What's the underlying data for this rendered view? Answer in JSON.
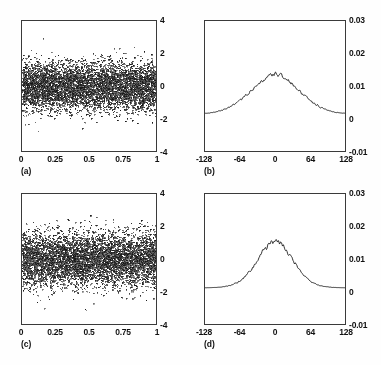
{
  "figure": {
    "title": "",
    "background_color": "#fefefe",
    "frame_color": "#3a3a3a",
    "data_color": "#1a1a1a",
    "layout": "2x2 grid of panels"
  },
  "panels": [
    {
      "id": "a",
      "caption": "(a)",
      "position": {
        "left": 21,
        "top": 20,
        "width": 136,
        "height": 132
      },
      "type": "scatter",
      "xticks": [
        "0",
        "0.25",
        "0.5",
        "0.75",
        "1"
      ],
      "yticks": [
        "4",
        "2",
        "0",
        "-2",
        "-4"
      ],
      "yaxis_side": "right"
    },
    {
      "id": "b",
      "caption": "(b)",
      "position": {
        "left": 204,
        "top": 20,
        "width": 142,
        "height": 132
      },
      "type": "line",
      "xticks": [
        "-128",
        "-64",
        "0",
        "64",
        "128"
      ],
      "yticks": [
        "0.03",
        "0.02",
        "0.01",
        "0",
        "-0.01"
      ],
      "yaxis_side": "right"
    },
    {
      "id": "c",
      "caption": "(c)",
      "position": {
        "left": 21,
        "top": 193,
        "width": 136,
        "height": 132
      },
      "type": "scatter",
      "xticks": [
        "0",
        "0.25",
        "0.5",
        "0.75",
        "1"
      ],
      "yticks": [
        "4",
        "2",
        "0",
        "-2",
        "-4"
      ],
      "yaxis_side": "right"
    },
    {
      "id": "d",
      "caption": "(d)",
      "position": {
        "left": 204,
        "top": 193,
        "width": 142,
        "height": 132
      },
      "type": "line",
      "xticks": [
        "-128",
        "-64",
        "0",
        "64",
        "128"
      ],
      "yticks": [
        "0.03",
        "0.02",
        "0.01",
        "0",
        "-0.01"
      ],
      "yaxis_side": "right"
    }
  ],
  "chart_data": [
    {
      "type": "scatter",
      "panel": "a",
      "title": "(a)",
      "xlabel": "",
      "ylabel": "",
      "xlim": [
        0,
        1
      ],
      "ylim": [
        -4,
        4
      ],
      "xticks": [
        0,
        0.25,
        0.5,
        0.75,
        1
      ],
      "yticks": [
        -4,
        -2,
        0,
        2,
        4
      ],
      "xtick_labels": [
        "0",
        "0.25",
        "0.5",
        "0.75",
        "1"
      ],
      "ytick_labels": [
        "-4",
        "-2",
        "0",
        "2",
        "4"
      ],
      "grid": false,
      "legend": null,
      "description": "Dense uniform random noise scatter, zero mean, spread mostly within +/-1.5 with sparse tails out to about +/-2.5; no visible trend across x.",
      "n_points": 6000,
      "noise_sigma": 0.72,
      "mean": 0.0,
      "seed": 101,
      "marker_size_px": 1
    },
    {
      "type": "line",
      "panel": "b",
      "title": "(b)",
      "xlabel": "",
      "ylabel": "",
      "xlim": [
        -128,
        128
      ],
      "ylim": [
        -0.01,
        0.03
      ],
      "xticks": [
        -128,
        -64,
        0,
        64,
        128
      ],
      "yticks": [
        -0.01,
        0,
        0.01,
        0.02,
        0.03
      ],
      "xtick_labels": [
        "-128",
        "-64",
        "0",
        "64",
        "128"
      ],
      "ytick_labels": [
        "-0.01",
        "0",
        "0.01",
        "0.02",
        "0.03"
      ],
      "grid": false,
      "legend": null,
      "description": "Broad bell-shaped spectral density peaking near 0.0135 at lag 0, half-width about 45, with small high-frequency jitter on the crest and flat baseline near 0.0012 at the edges.",
      "peak_value": 0.0135,
      "peak_x": 0,
      "baseline": 0.0012,
      "halfwidth": 45,
      "jitter_amplitude": 0.0009,
      "seed": 202,
      "x": [
        -128,
        -112,
        -96,
        -80,
        -64,
        -48,
        -32,
        -16,
        -8,
        0,
        8,
        16,
        32,
        48,
        64,
        80,
        96,
        112,
        128
      ],
      "y": [
        0.0012,
        0.0014,
        0.0017,
        0.0022,
        0.0031,
        0.005,
        0.0081,
        0.0118,
        0.013,
        0.0135,
        0.0131,
        0.0119,
        0.0082,
        0.0051,
        0.0032,
        0.0022,
        0.0017,
        0.0014,
        0.0012
      ]
    },
    {
      "type": "scatter",
      "panel": "c",
      "title": "(c)",
      "xlabel": "",
      "ylabel": "",
      "xlim": [
        0,
        1
      ],
      "ylim": [
        -4,
        4
      ],
      "xticks": [
        0,
        0.25,
        0.5,
        0.75,
        1
      ],
      "yticks": [
        -4,
        -2,
        0,
        2,
        4
      ],
      "xtick_labels": [
        "-4",
        "-2",
        "0",
        "2",
        "4"
      ],
      "ytick_labels": [
        "-4",
        "-2",
        "0",
        "2",
        "4"
      ],
      "grid": false,
      "legend": null,
      "description": "Dense uniform random noise scatter similar to panel (a) but with a slightly wider core band, zero mean, spread mostly within +/-1.6 and sparse tails reaching about +/-2.6.",
      "n_points": 6000,
      "noise_sigma": 0.8,
      "mean": 0.0,
      "seed": 303,
      "marker_size_px": 1
    },
    {
      "type": "line",
      "panel": "d",
      "title": "(d)",
      "xlabel": "",
      "ylabel": "",
      "xlim": [
        -128,
        128
      ],
      "ylim": [
        -0.01,
        0.03
      ],
      "xticks": [
        -128,
        -64,
        0,
        64,
        128
      ],
      "yticks": [
        -0.01,
        0,
        0.01,
        0.02,
        0.03
      ],
      "xtick_labels": [
        "-128",
        "-64",
        "0",
        "64",
        "128"
      ],
      "ytick_labels": [
        "-0.01",
        "0",
        "0.01",
        "0.02",
        "0.03"
      ],
      "grid": false,
      "legend": null,
      "description": "Narrower, taller bell-shaped spectral density peaking near 0.0155 at lag 0, half-width about 33, with jitter on the crest and flat baseline near 0.0010 at the edges.",
      "peak_value": 0.0155,
      "peak_x": 0,
      "baseline": 0.001,
      "halfwidth": 33,
      "jitter_amplitude": 0.001,
      "seed": 404,
      "x": [
        -128,
        -112,
        -96,
        -80,
        -64,
        -48,
        -32,
        -16,
        -8,
        0,
        8,
        16,
        32,
        48,
        64,
        80,
        96,
        112,
        128
      ],
      "y": [
        0.001,
        0.0011,
        0.0013,
        0.0016,
        0.0022,
        0.0036,
        0.007,
        0.0126,
        0.0147,
        0.0155,
        0.0148,
        0.0127,
        0.0071,
        0.0037,
        0.0023,
        0.0016,
        0.0013,
        0.0011,
        0.001
      ]
    }
  ]
}
